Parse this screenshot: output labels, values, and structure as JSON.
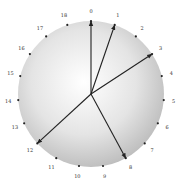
{
  "diagram": {
    "type": "circular-graph",
    "center": [
      91,
      94
    ],
    "radius": 73,
    "label_radius": 83,
    "point_count": 19,
    "points": [
      "0",
      "1",
      "2",
      "3",
      "4",
      "5",
      "6",
      "7",
      "8",
      "9",
      "10",
      "11",
      "12",
      "13",
      "14",
      "15",
      "16",
      "17",
      "18"
    ],
    "arrows_to": [
      0,
      1,
      3,
      8,
      12
    ],
    "colors": {
      "disk_center": "#ffffff",
      "disk_edge": "#bdbdbd",
      "point": "#222222",
      "arrow": "#222222",
      "label": "#333333"
    }
  }
}
